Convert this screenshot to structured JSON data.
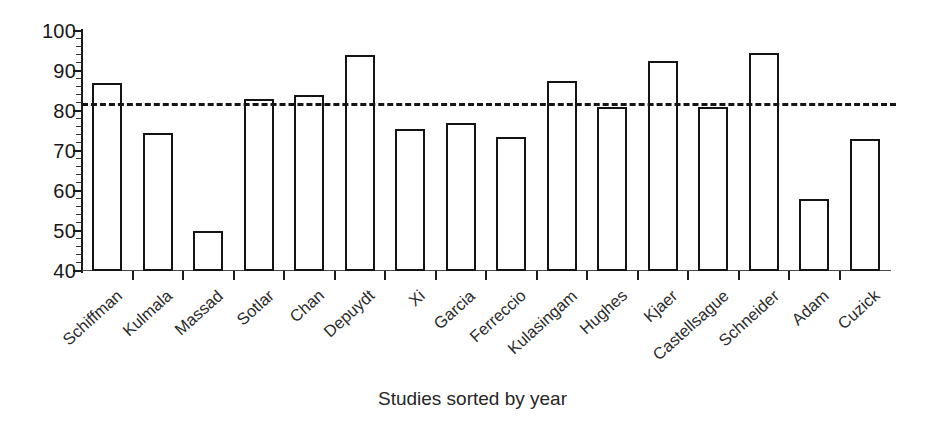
{
  "chart_data": {
    "type": "bar",
    "title": "",
    "subtitle": "",
    "xlabel": "Studies sorted by year",
    "ylabel": "",
    "ylim": [
      40,
      100
    ],
    "yticks": [
      40,
      50,
      60,
      70,
      80,
      90,
      100
    ],
    "ytick_labels": [
      "40",
      "50",
      "60",
      "70",
      "80",
      "90",
      "100"
    ],
    "minor_tick_step": 2,
    "grid": false,
    "legend": null,
    "bar_style": "hollow-outline",
    "categories": [
      "Schiffman",
      "Kulmala",
      "Massad",
      "Sotlar",
      "Chan",
      "Depuydt",
      "Xi",
      "Garcia",
      "Ferreccio",
      "Kulasingam",
      "Hughes",
      "Kjaer",
      "Castellsague",
      "Schneider",
      "Adam",
      "Cuzick"
    ],
    "values": [
      87,
      74.5,
      50,
      83,
      84,
      94,
      75.5,
      77,
      73.5,
      87.5,
      81,
      92.5,
      81,
      94.5,
      58,
      73
    ],
    "annotations": [
      {
        "type": "hline",
        "name": "pooled-estimate-line",
        "value": 82,
        "style": "dashed",
        "color": "#151515",
        "label": ""
      }
    ],
    "colors": {
      "bar_fill": "#ffffff",
      "bar_edge": "#141414",
      "axis": "#1b1b1b",
      "text": "#1a1a1a",
      "refline": "#151515"
    }
  }
}
